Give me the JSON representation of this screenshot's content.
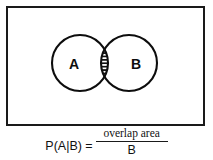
{
  "diagram": {
    "type": "venn-two-set",
    "border_color": "#1a1a1a",
    "stroke_color": "#0d0d0d",
    "background_color": "#ffffff",
    "sets": [
      {
        "id": "A",
        "label": "A",
        "cx": 72,
        "cy": 55,
        "r": 28
      },
      {
        "id": "B",
        "label": "B",
        "cx": 121,
        "cy": 55,
        "r": 28
      }
    ],
    "intersection": {
      "name": "overlap-region",
      "fill_pattern": "horizontal-hatch",
      "hatch_line_count": 10
    }
  },
  "formula": {
    "lhs": "P(A|B) =",
    "numerator": "overlap area",
    "denominator": "B"
  }
}
